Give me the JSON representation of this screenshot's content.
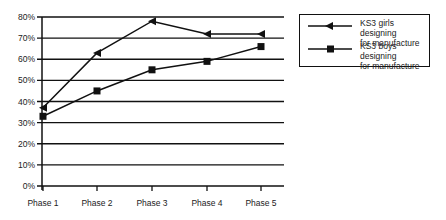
{
  "chart_data": {
    "type": "line",
    "title": "",
    "xlabel": "",
    "ylabel": "",
    "categories": [
      "Phase 1",
      "Phase 2",
      "Phase 3",
      "Phase 4",
      "Phase 5"
    ],
    "series": [
      {
        "name": "KS3 girls designing for manufacture",
        "marker": "triangle-left",
        "values": [
          37,
          63,
          78,
          72,
          72
        ]
      },
      {
        "name": "KS3 boys designing for manufacture",
        "marker": "square",
        "values": [
          33,
          45,
          55,
          59,
          66
        ]
      }
    ],
    "ylim": [
      0,
      80
    ],
    "yticks": [
      "0%",
      "10%",
      "20%",
      "30%",
      "40%",
      "50%",
      "60%",
      "70%",
      "80%"
    ],
    "grid": true,
    "legend_position": "right"
  },
  "legend": {
    "items": [
      {
        "line1": "KS3 girls designing",
        "line2": "for manufacture"
      },
      {
        "line1": "KS3 boys designing",
        "line2": "for manufacture"
      }
    ]
  },
  "colors": {
    "line": "#111111",
    "grid": "#111111",
    "text": "#222222"
  }
}
